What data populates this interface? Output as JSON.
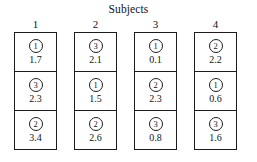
{
  "figure": {
    "title": "Subjects",
    "title_icon": "none"
  },
  "chart_data": {
    "type": "table",
    "title": "Subjects",
    "xlabel": "Subjects",
    "ylabel": "",
    "column_header_label": "Subject",
    "cell_fields": [
      "treatment",
      "response"
    ],
    "columns": [
      {
        "header": "1",
        "cells": [
          {
            "treatment": "1",
            "value": "1.7"
          },
          {
            "treatment": "3",
            "value": "2.3"
          },
          {
            "treatment": "2",
            "value": "3.4"
          }
        ]
      },
      {
        "header": "2",
        "cells": [
          {
            "treatment": "3",
            "value": "2.1"
          },
          {
            "treatment": "1",
            "value": "1.5"
          },
          {
            "treatment": "2",
            "value": "2.6"
          }
        ]
      },
      {
        "header": "3",
        "cells": [
          {
            "treatment": "1",
            "value": "0.1"
          },
          {
            "treatment": "2",
            "value": "2.3"
          },
          {
            "treatment": "3",
            "value": "0.8"
          }
        ]
      },
      {
        "header": "4",
        "cells": [
          {
            "treatment": "2",
            "value": "2.2"
          },
          {
            "treatment": "1",
            "value": "0.6"
          },
          {
            "treatment": "3",
            "value": "1.6"
          }
        ]
      }
    ]
  },
  "style": {
    "line_color": "#1c1c1c",
    "text_color": "#141414",
    "background": "#ffffff"
  }
}
